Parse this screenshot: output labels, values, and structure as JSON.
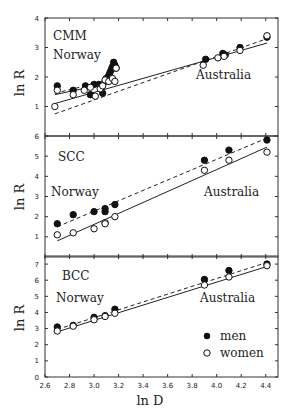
{
  "chart_data": [
    {
      "type": "scatter",
      "panel": "CMM",
      "title": "CMM",
      "xlabel": "ln D",
      "ylabel": "ln R",
      "xlim": [
        2.6,
        4.5
      ],
      "ylim": [
        0,
        4
      ],
      "yticks": [
        1,
        2,
        3,
        4
      ],
      "annotations": [
        "CMM",
        "Norway",
        "Australia"
      ],
      "series": [
        {
          "name": "men",
          "marker": "filled-circle",
          "points": [
            [
              2.7,
              1.7
            ],
            [
              2.83,
              1.55
            ],
            [
              2.93,
              1.7
            ],
            [
              2.97,
              1.4
            ],
            [
              3.0,
              1.75
            ],
            [
              3.04,
              1.75
            ],
            [
              3.07,
              1.45
            ],
            [
              3.09,
              1.85
            ],
            [
              3.1,
              1.95
            ],
            [
              3.12,
              2.05
            ],
            [
              3.13,
              2.15
            ],
            [
              3.14,
              2.25
            ],
            [
              3.15,
              2.35
            ],
            [
              3.16,
              2.5
            ],
            [
              3.17,
              2.4
            ],
            [
              3.18,
              2.3
            ],
            [
              3.91,
              2.6
            ],
            [
              4.05,
              2.8
            ],
            [
              4.07,
              2.75
            ],
            [
              4.19,
              3.0
            ],
            [
              4.41,
              3.35
            ]
          ]
        },
        {
          "name": "women",
          "marker": "open-circle",
          "points": [
            [
              2.68,
              1.0
            ],
            [
              2.7,
              1.55
            ],
            [
              2.83,
              1.4
            ],
            [
              2.92,
              1.55
            ],
            [
              2.97,
              1.65
            ],
            [
              3.01,
              1.35
            ],
            [
              3.05,
              1.6
            ],
            [
              3.07,
              1.7
            ],
            [
              3.09,
              1.9
            ],
            [
              3.12,
              1.85
            ],
            [
              3.15,
              1.95
            ],
            [
              3.17,
              1.85
            ],
            [
              3.18,
              2.3
            ],
            [
              3.89,
              2.4
            ],
            [
              4.06,
              2.7
            ],
            [
              4.01,
              2.65
            ],
            [
              4.19,
              2.9
            ],
            [
              4.41,
              3.4
            ]
          ]
        }
      ],
      "fits": [
        {
          "name": "men",
          "style": "dashed",
          "from": [
            2.68,
            0.75
          ],
          "to": [
            4.41,
            3.3
          ]
        },
        {
          "name": "women",
          "style": "solid",
          "from": [
            2.68,
            1.1
          ],
          "to": [
            4.41,
            3.15
          ]
        },
        {
          "name": "men-norway",
          "style": "solid",
          "from": [
            2.68,
            1.4
          ],
          "to": [
            3.18,
            1.85
          ]
        },
        {
          "name": "women-norway",
          "style": "dashed",
          "from": [
            2.68,
            1.45
          ],
          "to": [
            3.18,
            1.95
          ]
        }
      ]
    },
    {
      "type": "scatter",
      "panel": "SCC",
      "title": "SCC",
      "xlabel": "ln D",
      "ylabel": "ln R",
      "xlim": [
        2.6,
        4.5
      ],
      "ylim": [
        0,
        6
      ],
      "yticks": [
        1,
        2,
        3,
        4,
        5,
        6
      ],
      "annotations": [
        "SCC",
        "Norway",
        "Australia"
      ],
      "series": [
        {
          "name": "men",
          "marker": "filled-circle",
          "points": [
            [
              2.7,
              1.65
            ],
            [
              2.83,
              2.1
            ],
            [
              3.0,
              2.25
            ],
            [
              3.09,
              2.4
            ],
            [
              3.09,
              2.25
            ],
            [
              3.17,
              2.6
            ],
            [
              3.9,
              4.8
            ],
            [
              4.1,
              5.3
            ],
            [
              4.41,
              5.8
            ]
          ]
        },
        {
          "name": "women",
          "marker": "open-circle",
          "points": [
            [
              2.7,
              1.1
            ],
            [
              2.83,
              1.2
            ],
            [
              3.0,
              1.4
            ],
            [
              3.09,
              1.7
            ],
            [
              3.09,
              1.65
            ],
            [
              3.17,
              2.0
            ],
            [
              3.9,
              4.3
            ],
            [
              4.1,
              4.8
            ],
            [
              4.41,
              5.2
            ]
          ]
        }
      ],
      "fits": [
        {
          "name": "men",
          "style": "dashed",
          "from": [
            2.7,
            1.5
          ],
          "to": [
            4.41,
            5.9
          ]
        },
        {
          "name": "women",
          "style": "solid",
          "from": [
            2.7,
            0.8
          ],
          "to": [
            4.41,
            5.45
          ]
        }
      ]
    },
    {
      "type": "scatter",
      "panel": "BCC",
      "title": "BCC",
      "xlabel": "ln D",
      "ylabel": "ln R",
      "xlim": [
        2.6,
        4.5
      ],
      "ylim": [
        0,
        7.5
      ],
      "yticks": [
        0,
        1,
        2,
        3,
        4,
        5,
        6,
        7
      ],
      "xticks": [
        2.6,
        2.8,
        3.0,
        3.2,
        3.4,
        3.6,
        3.8,
        4.0,
        4.2,
        4.4
      ],
      "annotations": [
        "BCC",
        "Norway",
        "Australia"
      ],
      "legend": {
        "position": "lower right",
        "entries": [
          "men",
          "women"
        ]
      },
      "series": [
        {
          "name": "men",
          "marker": "filled-circle",
          "points": [
            [
              2.7,
              3.1
            ],
            [
              2.83,
              3.2
            ],
            [
              3.0,
              3.7
            ],
            [
              3.09,
              3.8
            ],
            [
              3.17,
              4.2
            ],
            [
              3.9,
              6.05
            ],
            [
              4.1,
              6.6
            ],
            [
              4.41,
              7.0
            ]
          ]
        },
        {
          "name": "women",
          "marker": "open-circle",
          "points": [
            [
              2.7,
              2.85
            ],
            [
              2.83,
              3.15
            ],
            [
              3.0,
              3.55
            ],
            [
              3.09,
              3.75
            ],
            [
              3.17,
              3.95
            ],
            [
              3.9,
              5.7
            ],
            [
              4.1,
              6.2
            ],
            [
              4.41,
              6.9
            ]
          ]
        }
      ],
      "fits": [
        {
          "name": "men",
          "style": "dashed",
          "from": [
            2.7,
            2.95
          ],
          "to": [
            4.41,
            7.1
          ]
        },
        {
          "name": "women",
          "style": "solid",
          "from": [
            2.7,
            2.8
          ],
          "to": [
            4.41,
            6.85
          ]
        }
      ]
    }
  ],
  "labels": {
    "xlabel": "ln D",
    "ylabel": "ln R",
    "norway": "Norway",
    "australia": "Australia",
    "legend_men": "men",
    "legend_women": "women",
    "panel_titles": [
      "CMM",
      "SCC",
      "BCC"
    ]
  }
}
